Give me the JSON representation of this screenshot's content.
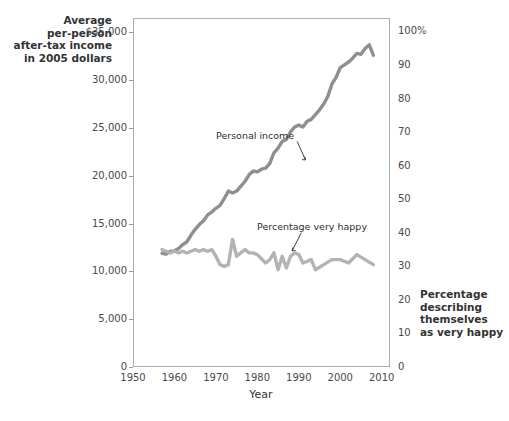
{
  "chart_data": {
    "type": "line",
    "title": "",
    "subtitle": "",
    "xlabel": "Year",
    "ylabel": "Average per-person after-tax income in 2005 dollars",
    "y2label": "Percentage describing themselves as very happy",
    "xlim": [
      1950,
      2012
    ],
    "ylim": [
      0,
      36500
    ],
    "y2lim": [
      0,
      104
    ],
    "grid": true,
    "legend_position": "inline-annotations",
    "xticks": [
      "1950",
      "1960",
      "1970",
      "1980",
      "1990",
      "2000",
      "2010"
    ],
    "xtick_values": [
      1950,
      1960,
      1970,
      1980,
      1990,
      2000,
      2010
    ],
    "yticks": [
      "$35,000",
      "30,000",
      "25,000",
      "20,000",
      "15,000",
      "10,000",
      "5,000",
      "0"
    ],
    "ytick_values": [
      35000,
      30000,
      25000,
      20000,
      15000,
      10000,
      5000,
      0
    ],
    "y2ticks": [
      "100%",
      "90",
      "80",
      "70",
      "60",
      "50",
      "40",
      "30",
      "20",
      "10",
      "0"
    ],
    "y2tick_values": [
      100,
      90,
      80,
      70,
      60,
      50,
      40,
      30,
      20,
      10,
      0
    ],
    "series": [
      {
        "name": "Personal income",
        "axis": "left",
        "color": "#8f8f8f",
        "x": [
          1957,
          1958,
          1959,
          1960,
          1961,
          1962,
          1963,
          1964,
          1965,
          1966,
          1967,
          1968,
          1969,
          1970,
          1971,
          1972,
          1973,
          1974,
          1975,
          1976,
          1977,
          1978,
          1979,
          1980,
          1981,
          1982,
          1983,
          1984,
          1985,
          1986,
          1987,
          1988,
          1989,
          1990,
          1991,
          1992,
          1993,
          1994,
          1995,
          1996,
          1997,
          1998,
          1999,
          2000,
          2001,
          2002,
          2003,
          2004,
          2005,
          2006,
          2007,
          2008
        ],
        "values": [
          11900,
          11800,
          12100,
          12150,
          12400,
          12800,
          13100,
          13800,
          14400,
          14900,
          15300,
          15900,
          16200,
          16600,
          16900,
          17600,
          18400,
          18200,
          18400,
          18900,
          19400,
          20100,
          20500,
          20400,
          20700,
          20800,
          21300,
          22400,
          22900,
          23600,
          23800,
          24600,
          25100,
          25300,
          25100,
          25700,
          25900,
          26400,
          26900,
          27500,
          28300,
          29600,
          30300,
          31300,
          31600,
          31900,
          32300,
          32800,
          32700,
          33300,
          33700,
          32600
        ]
      },
      {
        "name": "Percentage very happy",
        "axis": "right",
        "color": "#b3b3b3",
        "x": [
          1957,
          1958,
          1959,
          1960,
          1961,
          1962,
          1963,
          1964,
          1965,
          1966,
          1967,
          1968,
          1969,
          1970,
          1971,
          1972,
          1973,
          1974,
          1975,
          1976,
          1977,
          1978,
          1979,
          1980,
          1982,
          1983,
          1984,
          1985,
          1986,
          1987,
          1988,
          1989,
          1990,
          1991,
          1993,
          1994,
          1996,
          1998,
          2000,
          2002,
          2004,
          2006,
          2008
        ],
        "values": [
          35.0,
          34.5,
          34.0,
          34.5,
          34.0,
          34.5,
          34.0,
          34.5,
          35.0,
          34.5,
          35.0,
          34.5,
          35.0,
          33.0,
          30.5,
          30.0,
          30.5,
          38.0,
          33.0,
          34.0,
          35.0,
          34.0,
          34.0,
          33.5,
          31.0,
          32.0,
          34.0,
          29.0,
          33.0,
          29.5,
          33.0,
          34.0,
          33.5,
          31.0,
          32.0,
          29.0,
          30.5,
          32.0,
          32.0,
          31.0,
          33.5,
          32.0,
          30.5
        ]
      }
    ],
    "annotations": [
      {
        "text": "Personal income",
        "x": 1984,
        "y": 24000
      },
      {
        "text": "Percentage very happy",
        "x": 1987,
        "y": 14600
      }
    ]
  },
  "axes": {
    "left_caption": "Average\nper-person\nafter-tax income\nin 2005 dollars",
    "right_caption": "Percentage\ndescribing\nthemselves\nas very happy",
    "x_title": "Year"
  }
}
